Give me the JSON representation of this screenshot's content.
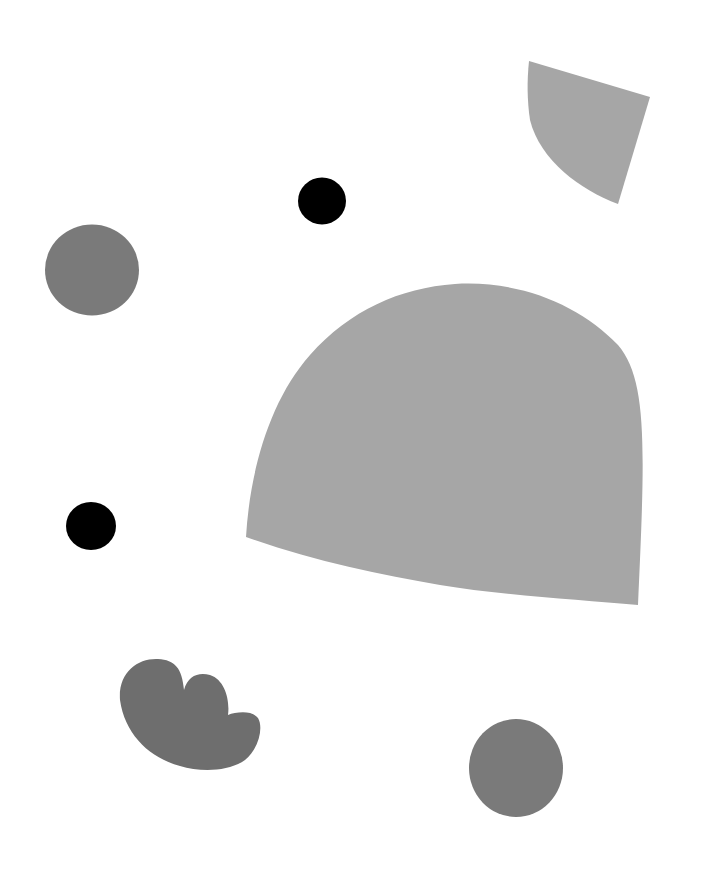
{
  "colors": {
    "background": "#ffffff",
    "light_gray": "#a6a6a6",
    "mid_gray": "#7a7a7a",
    "dark_gray": "#6e6e6e",
    "black": "#000000"
  },
  "shapes": [
    {
      "name": "quarter-fan-shape",
      "kind": "fan",
      "color_key": "light_gray"
    },
    {
      "name": "small-black-circle-top",
      "kind": "circle",
      "color_key": "black"
    },
    {
      "name": "gray-circle-left",
      "kind": "circle",
      "color_key": "mid_gray"
    },
    {
      "name": "large-dome-shape",
      "kind": "dome",
      "color_key": "light_gray"
    },
    {
      "name": "small-black-circle-left",
      "kind": "circle",
      "color_key": "black"
    },
    {
      "name": "cloud-shape",
      "kind": "cloud",
      "color_key": "dark_gray"
    },
    {
      "name": "gray-circle-bottom",
      "kind": "circle",
      "color_key": "mid_gray"
    }
  ]
}
